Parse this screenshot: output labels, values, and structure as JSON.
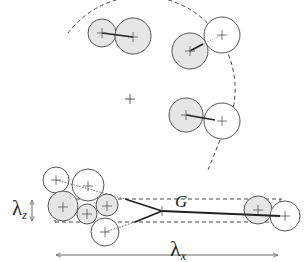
{
  "labels": {
    "lambda_z": "λ",
    "lambda_z_sub": "z",
    "lambda_x": "λ",
    "lambda_x_sub": "x",
    "G": "G"
  },
  "colors": {
    "stroke": "#555555",
    "fill_shaded": "#e6e6e6",
    "fill_open": "#ffffff",
    "line_dark": "#222222",
    "dashed": "#444444"
  },
  "top_group": {
    "center": [
      130,
      100
    ],
    "arc_radius": 93,
    "pairs": [
      {
        "a": {
          "cx": 102,
          "cy": 33,
          "r": 14,
          "shaded": true
        },
        "b": {
          "cx": 133,
          "cy": 36,
          "r": 18,
          "shaded": true
        }
      },
      {
        "a": {
          "cx": 190,
          "cy": 51,
          "r": 18,
          "shaded": true
        },
        "b": {
          "cx": 222,
          "cy": 35,
          "r": 18,
          "shaded": false
        }
      },
      {
        "a": {
          "cx": 186,
          "cy": 115,
          "r": 17,
          "shaded": true
        },
        "b": {
          "cx": 222,
          "cy": 121,
          "r": 18,
          "shaded": false
        }
      }
    ]
  },
  "bottom_group": {
    "box": {
      "x1": 55,
      "y1": 199,
      "x2": 280,
      "y2": 222
    },
    "node_G": [
      162,
      211
    ]
  }
}
